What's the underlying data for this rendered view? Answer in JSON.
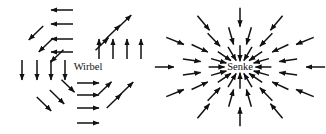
{
  "figure": {
    "background_color": "#ffffff",
    "arrow_color": "#111111",
    "width": 326,
    "height": 134
  },
  "fields": [
    {
      "id": "wirbel",
      "label": "Wirbel",
      "type": "vortex",
      "rotation": "counterclockwise",
      "center": {
        "x": 88,
        "y": 67
      },
      "label_position": {
        "x": 88,
        "y": 68
      }
    },
    {
      "id": "senke",
      "label": "Senke",
      "type": "sink",
      "flow": "inward",
      "center": {
        "x": 240,
        "y": 67
      },
      "label_position": {
        "x": 240,
        "y": 68
      }
    }
  ],
  "chart_data": {
    "type": "scatter",
    "title": "",
    "xlabel": "",
    "ylabel": "",
    "plots": [
      {
        "name": "Wirbel",
        "field_type": "vortex",
        "description": "Counterclockwise rotational vector field around a center point",
        "center": [
          88,
          67
        ],
        "vectors": [
          {
            "x": 62,
            "y": 10,
            "dx": -1.0,
            "dy": 0.0,
            "len": 22
          },
          {
            "x": 62,
            "y": 24,
            "dx": -1.0,
            "dy": 0.0,
            "len": 22
          },
          {
            "x": 62,
            "y": 39,
            "dx": -1.0,
            "dy": 0.0,
            "len": 22
          },
          {
            "x": 62,
            "y": 52,
            "dx": -1.0,
            "dy": 0.0,
            "len": 22
          },
          {
            "x": 36,
            "y": 33,
            "dx": -0.72,
            "dy": 0.69,
            "len": 20
          },
          {
            "x": 46,
            "y": 45,
            "dx": -0.72,
            "dy": 0.69,
            "len": 20
          },
          {
            "x": 57,
            "y": 56,
            "dx": -0.72,
            "dy": 0.69,
            "len": 18
          },
          {
            "x": 22,
            "y": 70,
            "dx": 0.0,
            "dy": 1.0,
            "len": 20
          },
          {
            "x": 37,
            "y": 70,
            "dx": 0.0,
            "dy": 1.0,
            "len": 20
          },
          {
            "x": 51,
            "y": 70,
            "dx": 0.0,
            "dy": 1.0,
            "len": 20
          },
          {
            "x": 65,
            "y": 70,
            "dx": 0.0,
            "dy": 1.0,
            "len": 20
          },
          {
            "x": 44,
            "y": 104,
            "dx": 0.72,
            "dy": 0.69,
            "len": 20
          },
          {
            "x": 57,
            "y": 97,
            "dx": 0.72,
            "dy": 0.69,
            "len": 20
          },
          {
            "x": 68,
            "y": 86,
            "dx": 0.72,
            "dy": 0.69,
            "len": 18
          },
          {
            "x": 88,
            "y": 83,
            "dx": 1.0,
            "dy": 0.0,
            "len": 22
          },
          {
            "x": 88,
            "y": 95,
            "dx": 1.0,
            "dy": 0.0,
            "len": 22
          },
          {
            "x": 88,
            "y": 108,
            "dx": 1.0,
            "dy": 0.0,
            "len": 22
          },
          {
            "x": 88,
            "y": 123,
            "dx": 1.0,
            "dy": 0.0,
            "len": 22
          },
          {
            "x": 114,
            "y": 101,
            "dx": 0.72,
            "dy": -0.69,
            "len": 20
          },
          {
            "x": 126,
            "y": 89,
            "dx": 0.72,
            "dy": -0.69,
            "len": 20
          },
          {
            "x": 105,
            "y": 88,
            "dx": 0.72,
            "dy": -0.69,
            "len": 18
          },
          {
            "x": 113,
            "y": 49,
            "dx": 0.0,
            "dy": -1.0,
            "len": 20
          },
          {
            "x": 127,
            "y": 49,
            "dx": 0.0,
            "dy": -1.0,
            "len": 20
          },
          {
            "x": 141,
            "y": 49,
            "dx": 0.0,
            "dy": -1.0,
            "len": 20
          },
          {
            "x": 99,
            "y": 49,
            "dx": 0.0,
            "dy": -1.0,
            "len": 20
          },
          {
            "x": 113,
            "y": 32,
            "dx": 0.72,
            "dy": -0.69,
            "len": 20
          },
          {
            "x": 102,
            "y": 44,
            "dx": 0.72,
            "dy": -0.69,
            "len": 18
          },
          {
            "x": 124,
            "y": 22,
            "dx": 0.72,
            "dy": -0.69,
            "len": 20
          }
        ]
      },
      {
        "name": "Senke",
        "field_type": "sink",
        "description": "Radially convergent vector field, all arrows point inward to the center",
        "center": [
          240,
          67
        ],
        "rings": [
          {
            "radius": 28,
            "count": 16,
            "arrow_len": 16
          },
          {
            "radius": 52,
            "count": 16,
            "arrow_len": 18
          },
          {
            "radius": 76,
            "count": 12,
            "arrow_len": 19
          }
        ]
      }
    ]
  }
}
